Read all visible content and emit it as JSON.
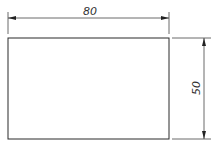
{
  "drawing": {
    "shape": "rectangle",
    "width_dimension": "80",
    "height_dimension": "50",
    "line_color": "#2a2a2a",
    "background": "#ffffff"
  }
}
